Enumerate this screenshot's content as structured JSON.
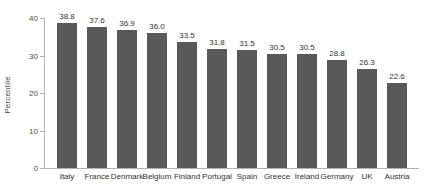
{
  "chart_data": {
    "type": "bar",
    "title": "",
    "xlabel": "",
    "ylabel": "Percentile",
    "ylim": [
      0,
      40
    ],
    "yticks": [
      0,
      10,
      20,
      30,
      40
    ],
    "grid": false,
    "legend": null,
    "bar_color": "#595959",
    "axis_color": "#b3b3b3",
    "categories": [
      "Italy",
      "France",
      "Denmark",
      "Belgium",
      "Finland",
      "Portugal",
      "Spain",
      "Greece",
      "Ireland",
      "Germany",
      "UK",
      "Austria"
    ],
    "values": [
      38.8,
      37.6,
      36.9,
      36.0,
      33.5,
      31.8,
      31.5,
      30.5,
      30.5,
      28.8,
      26.3,
      22.6
    ],
    "value_labels": [
      "38.8",
      "37.6",
      "36.9",
      "36.0",
      "33.5",
      "31.8",
      "31.5",
      "30.5",
      "30.5",
      "28.8",
      "26.3",
      "22.6"
    ],
    "ytick_labels": [
      "0",
      "10",
      "20",
      "30",
      "40"
    ]
  }
}
